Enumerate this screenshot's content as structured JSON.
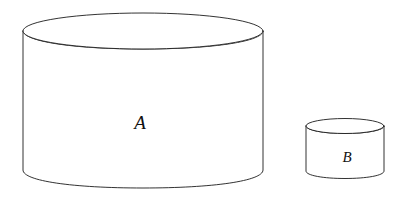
{
  "figure": {
    "background_color": "#ffffff",
    "stroke_color": "#1c1c1c",
    "label_color": "#111111",
    "width": 404,
    "height": 206,
    "shapes": [
      {
        "id": "cylinder-a",
        "label": "A",
        "type": "cylinder",
        "size": "large",
        "label_position": {
          "x": 140,
          "y": 122
        },
        "geometry": {
          "left_x": 23,
          "right_x": 263,
          "top_ellipse_center_y": 31,
          "top_ellipse_rx": 120,
          "top_ellipse_ry": 18,
          "side_bottom_y": 170,
          "bottom_arc_depth_y": 188
        }
      },
      {
        "id": "cylinder-b",
        "label": "B",
        "type": "cylinder",
        "size": "small",
        "label_position": {
          "x": 347,
          "y": 157
        },
        "geometry": {
          "left_x": 306,
          "right_x": 384,
          "top_ellipse_center_y": 126,
          "top_ellipse_rx": 39,
          "top_ellipse_ry": 7.5,
          "side_bottom_y": 171,
          "bottom_arc_depth_y": 178.5
        }
      }
    ]
  }
}
